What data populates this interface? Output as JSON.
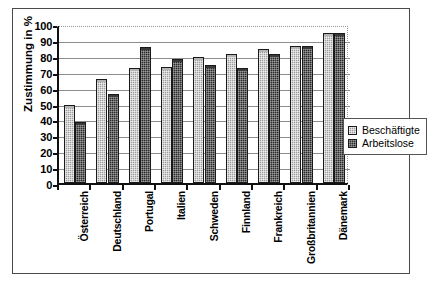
{
  "chart_data": {
    "type": "bar",
    "title": "",
    "xlabel": "",
    "ylabel": "Zustimmung in %",
    "ylim": [
      0,
      100
    ],
    "ytick_step": 10,
    "yticks": [
      "0",
      "10",
      "20",
      "30",
      "40",
      "50",
      "60",
      "70",
      "80",
      "90",
      "100"
    ],
    "grid": true,
    "legend_position": "right",
    "categories": [
      "Österreich",
      "Deutschland",
      "Portugal",
      "Italien",
      "Schweden",
      "Finnland",
      "Frankreich",
      "Großbritannien",
      "Dänemark"
    ],
    "series": [
      {
        "name": "Beschäftigte",
        "color": "#9d9d9d",
        "values": [
          48,
          64,
          71,
          72,
          78,
          80,
          83,
          85,
          93
        ]
      },
      {
        "name": "Arbeitslose",
        "color": "#2c2c2c",
        "values": [
          37,
          55,
          84,
          77,
          73,
          71,
          80,
          85,
          93
        ]
      }
    ]
  },
  "legend": {
    "items": [
      {
        "label": "Beschäftigte",
        "swatch": "light-hatched-swatch"
      },
      {
        "label": "Arbeitslose",
        "swatch": "dark-hatched-swatch"
      }
    ]
  }
}
